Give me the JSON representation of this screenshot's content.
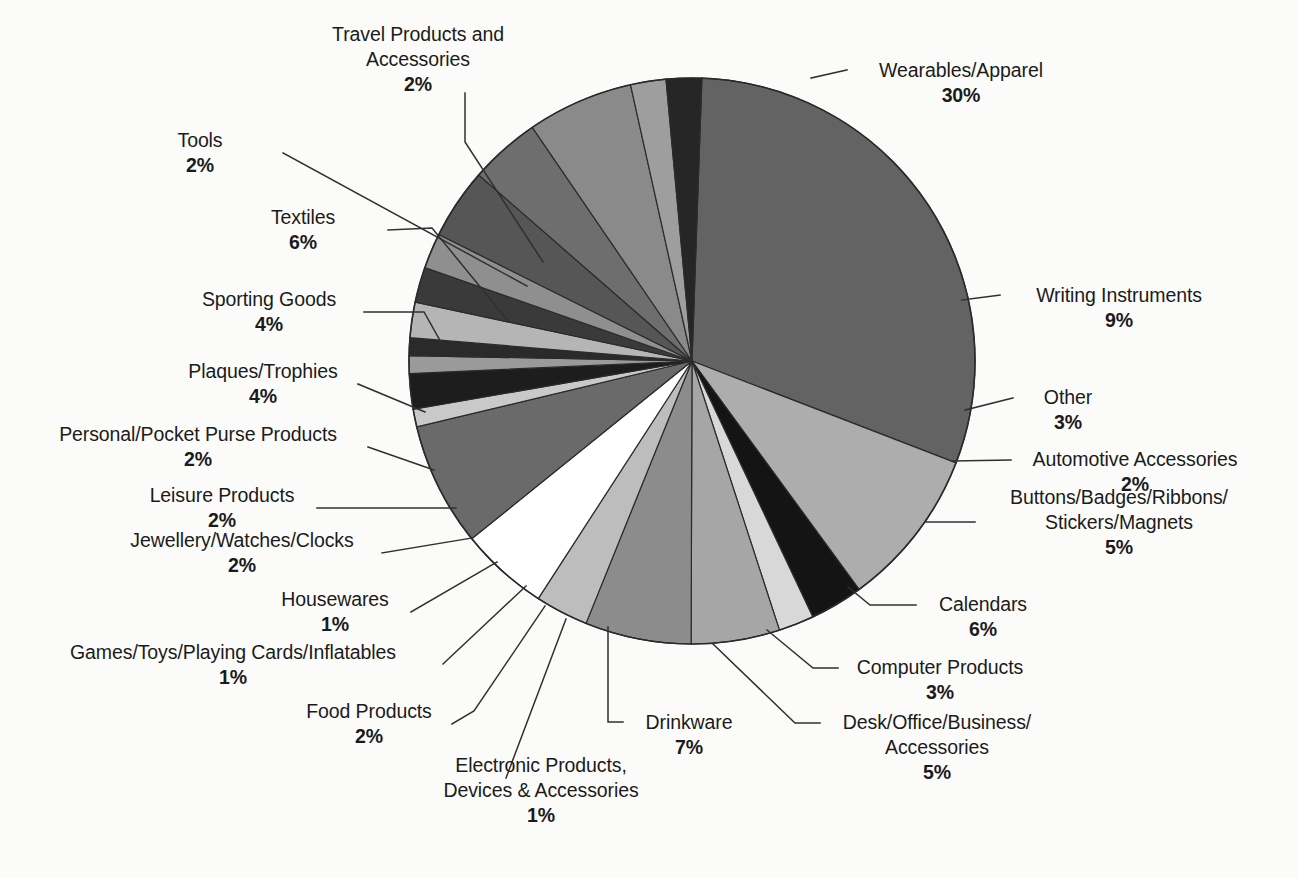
{
  "figure": {
    "background_color": "#fbfbfa",
    "outline_color": "#2b2b2b",
    "center": {
      "x": 692,
      "y": 361
    },
    "radius": 283
  },
  "chart_data": {
    "type": "pie",
    "title": "",
    "subtitle": "",
    "xlabel": "",
    "ylabel": "",
    "legend_position": "none",
    "grid": false,
    "units": "percent",
    "total": 100,
    "start_angle_deg": -88,
    "direction": "clockwise",
    "categories": [
      "Wearables/Apparel",
      "Writing Instruments",
      "Other",
      "Automotive Accessories",
      "Buttons/Badges/Ribbons/Stickers/Magnets",
      "Calendars",
      "Computer Products",
      "Desk/Office/Business/Accessories",
      "Drinkware",
      "Electronic Products, Devices & Accessories",
      "Food Products",
      "Games/Toys/Playing Cards/Inflatables",
      "Housewares",
      "Jewellery/Watches/Clocks",
      "Leisure Products",
      "Personal/Pocket Purse Products",
      "Plaques/Trophies",
      "Sporting Goods",
      "Textiles",
      "Tools",
      "Travel Products and Accessories"
    ],
    "values": [
      30,
      9,
      3,
      2,
      5,
      6,
      3,
      5,
      7,
      1,
      2,
      1,
      1,
      2,
      2,
      2,
      4,
      4,
      6,
      2,
      2
    ],
    "colors": [
      "#636363",
      "#adadad",
      "#141414",
      "#d8d8d8",
      "#a6a6a6",
      "#8c8c8c",
      "#bdbdbd",
      "#ffffff",
      "#6a6a6a",
      "#c9c9c9",
      "#1d1d1d",
      "#9a9a9a",
      "#2a2a2a",
      "#b5b5b5",
      "#3a3a3a",
      "#8f8f8f",
      "#565656",
      "#6e6e6e",
      "#8a8a8a",
      "#9e9e9e",
      "#262626"
    ],
    "slices": [
      {
        "label": "Wearables/Apparel",
        "value": 30,
        "display": "30%",
        "color": "#636363"
      },
      {
        "label": "Writing Instruments",
        "value": 9,
        "display": "9%",
        "color": "#adadad"
      },
      {
        "label": "Other",
        "value": 3,
        "display": "3%",
        "color": "#141414"
      },
      {
        "label": "Automotive Accessories",
        "value": 2,
        "display": "2%",
        "color": "#d8d8d8"
      },
      {
        "label": "Buttons/Badges/Ribbons/Stickers/Magnets",
        "value": 5,
        "display": "5%",
        "color": "#a6a6a6"
      },
      {
        "label": "Calendars",
        "value": 6,
        "display": "6%",
        "color": "#8c8c8c"
      },
      {
        "label": "Computer Products",
        "value": 3,
        "display": "3%",
        "color": "#bdbdbd"
      },
      {
        "label": "Desk/Office/Business/Accessories",
        "value": 5,
        "display": "5%",
        "color": "#ffffff"
      },
      {
        "label": "Drinkware",
        "value": 7,
        "display": "7%",
        "color": "#6a6a6a"
      },
      {
        "label": "Electronic Products, Devices & Accessories",
        "value": 1,
        "display": "1%",
        "color": "#c9c9c9"
      },
      {
        "label": "Food Products",
        "value": 2,
        "display": "2%",
        "color": "#1d1d1d"
      },
      {
        "label": "Games/Toys/Playing Cards/Inflatables",
        "value": 1,
        "display": "1%",
        "color": "#9a9a9a"
      },
      {
        "label": "Housewares",
        "value": 1,
        "display": "1%",
        "color": "#2a2a2a"
      },
      {
        "label": "Jewellery/Watches/Clocks",
        "value": 2,
        "display": "2%",
        "color": "#b5b5b5"
      },
      {
        "label": "Leisure Products",
        "value": 2,
        "display": "2%",
        "color": "#3a3a3a"
      },
      {
        "label": "Personal/Pocket Purse Products",
        "value": 2,
        "display": "2%",
        "color": "#8f8f8f"
      },
      {
        "label": "Plaques/Trophies",
        "value": 4,
        "display": "4%",
        "color": "#565656"
      },
      {
        "label": "Sporting Goods",
        "value": 4,
        "display": "4%",
        "color": "#6e6e6e"
      },
      {
        "label": "Textiles",
        "value": 6,
        "display": "6%",
        "color": "#8a8a8a"
      },
      {
        "label": "Tools",
        "value": 2,
        "display": "2%",
        "color": "#9e9e9e"
      },
      {
        "label": "Travel Products and Accessories",
        "value": 2,
        "display": "2%",
        "color": "#262626"
      }
    ]
  },
  "labels": {
    "travel": {
      "line1": "Travel Products and",
      "line2": "Accessories",
      "pct": "2%"
    },
    "tools": {
      "line1": "Tools",
      "pct": "2%"
    },
    "textiles": {
      "line1": "Textiles",
      "pct": "6%"
    },
    "sporting": {
      "line1": "Sporting Goods",
      "pct": "4%"
    },
    "plaques": {
      "line1": "Plaques/Trophies",
      "pct": "4%"
    },
    "personal": {
      "line1": "Personal/Pocket Purse Products",
      "pct": "2%"
    },
    "leisure": {
      "line1": "Leisure Products",
      "pct": "2%"
    },
    "jewellery": {
      "line1": "Jewellery/Watches/Clocks",
      "pct": "2%"
    },
    "housewares": {
      "line1": "Housewares",
      "pct": "1%"
    },
    "games": {
      "line1": "Games/Toys/Playing Cards/Inflatables",
      "pct": "1%"
    },
    "food": {
      "line1": "Food Products",
      "pct": "2%"
    },
    "electronic": {
      "line1": "Electronic Products,",
      "line2": "Devices & Accessories",
      "pct": "1%"
    },
    "drinkware": {
      "line1": "Drinkware",
      "pct": "7%"
    },
    "desk": {
      "line1": "Desk/Office/Business/",
      "line2": "Accessories",
      "pct": "5%"
    },
    "computer": {
      "line1": "Computer Products",
      "pct": "3%"
    },
    "calendars": {
      "line1": "Calendars",
      "pct": "6%"
    },
    "buttons": {
      "line1": "Buttons/Badges/Ribbons/",
      "line2": "Stickers/Magnets",
      "pct": "5%"
    },
    "automotive": {
      "line1": "Automotive Accessories",
      "pct": "2%"
    },
    "other": {
      "line1": "Other",
      "pct": "3%"
    },
    "writing": {
      "line1": "Writing Instruments",
      "pct": "9%"
    },
    "wearables": {
      "line1": "Wearables/Apparel",
      "pct": "30%"
    }
  }
}
